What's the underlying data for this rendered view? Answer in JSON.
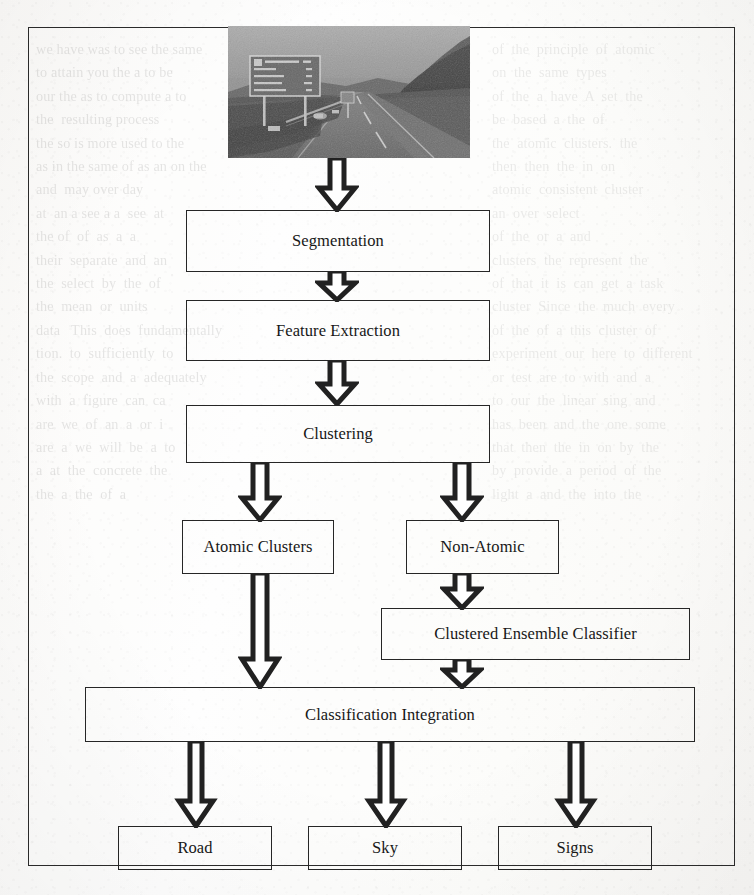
{
  "page": {
    "kind": "scanned-journal-page",
    "width": 754,
    "height": 895,
    "ink_color": "#212121",
    "paper_color": "#fdfdfc"
  },
  "figure": {
    "name": "system-architecture-flowchart",
    "photo": {
      "caption_text": "",
      "description_semantic": "roadway-scene-photograph",
      "sign_lines": [
        "M1 LIMERICK",
        "Cork",
        "Bantry Bay",
        "Lahinch",
        "Pt. Limerick"
      ]
    },
    "nodes": [
      {
        "id": "segmentation",
        "label": "Segmentation"
      },
      {
        "id": "feature_extraction",
        "label": "Feature Extraction"
      },
      {
        "id": "clustering",
        "label": "Clustering"
      },
      {
        "id": "atomic_clusters",
        "label": "Atomic Clusters"
      },
      {
        "id": "non_atomic",
        "label": "Non-Atomic"
      },
      {
        "id": "ensemble_classifier",
        "label": "Clustered Ensemble Classifier"
      },
      {
        "id": "classification_integration",
        "label": "Classification Integration"
      },
      {
        "id": "road",
        "label": "Road"
      },
      {
        "id": "sky",
        "label": "Sky"
      },
      {
        "id": "signs",
        "label": "Signs"
      }
    ],
    "edges": [
      {
        "from": "photo",
        "to": "segmentation"
      },
      {
        "from": "segmentation",
        "to": "feature_extraction"
      },
      {
        "from": "feature_extraction",
        "to": "clustering"
      },
      {
        "from": "clustering",
        "to": "atomic_clusters"
      },
      {
        "from": "clustering",
        "to": "non_atomic"
      },
      {
        "from": "atomic_clusters",
        "to": "classification_integration"
      },
      {
        "from": "non_atomic",
        "to": "ensemble_classifier"
      },
      {
        "from": "ensemble_classifier",
        "to": "classification_integration"
      },
      {
        "from": "classification_integration",
        "to": "road"
      },
      {
        "from": "classification_integration",
        "to": "sky"
      },
      {
        "from": "classification_integration",
        "to": "signs"
      }
    ]
  },
  "bleed_through": {
    "note": "faint mirrored text showing through from the reverse side of the scanned sheet",
    "left_column": [
      "we have was to see the same",
      "to attain you the a to be",
      "our the as to compute a to",
      "the  resulting process",
      "the so is more used to the",
      "as in the same of as an on the",
      "and  may over day",
      "at  an a see a a  see  at",
      "the of  of  as  a  a",
      "their  separate  and  an",
      "the  select  by  the  of",
      "the  mean  or  units",
      "data   This  does  fundamentally",
      "tion.  to  sufficiently  to",
      "the  scope  and  a  adequately",
      "with  a  figure  can  ca",
      "are  we  of  an  a  or  i",
      "are  a  we  will  be  a  to",
      "a  at  the  concrete  the",
      "the  a  the  of  a"
    ],
    "right_column": [
      "of  the  principle  of  atomic",
      "on  the  same  types",
      "of  the  a  have  A  set  the",
      "be  based  a  the  of",
      "the  atomic  clusters.  the",
      "then  then  the  in  on",
      "atomic  consistent  cluster",
      "an  over  select",
      "of  the  or  a  and",
      "clusters  the  represent  the",
      "of  that  it  is  can  get  a  task",
      "cluster  Since  the  much  every",
      "of  the  of  a  this  cluster  of",
      "experiment  our  here  to  different",
      "or  test  are  to  with  and  a",
      "to  our  the  linear  sing  and",
      "has  been  and  the  one  some",
      "that  then  the  in  on  by  the",
      "by  provide  a  period  of  the",
      "light  a  and  the  into  the"
    ]
  }
}
